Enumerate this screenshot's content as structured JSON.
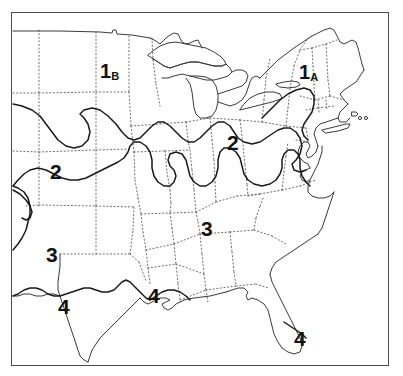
{
  "map": {
    "title": "Climate Zone Map of the Eastern and Central United States",
    "frame_color": "#4a4a4a",
    "background_color": "#ffffff",
    "coastline_color": "#3b3b3b",
    "zone_boundary_color": "#1a1a1a",
    "state_border_color": "#6e6e6e",
    "state_border_style": "dotted",
    "label_color": "#121212",
    "zones": [
      {
        "id": "zone-1b",
        "number": "1",
        "suffix": "B",
        "label": "1B",
        "x": 106,
        "y": 71,
        "region": "northern-plains"
      },
      {
        "id": "zone-1a",
        "number": "1",
        "suffix": "A",
        "label": "1A",
        "x": 305,
        "y": 72,
        "region": "new-england"
      },
      {
        "id": "zone-2-west",
        "number": "2",
        "suffix": "",
        "label": "2",
        "x": 54,
        "y": 172,
        "region": "central-plains"
      },
      {
        "id": "zone-2-east",
        "number": "2",
        "suffix": "",
        "label": "2",
        "x": 231,
        "y": 143,
        "region": "ohio-valley"
      },
      {
        "id": "zone-3-west",
        "number": "3",
        "suffix": "",
        "label": "3",
        "x": 50,
        "y": 255,
        "region": "southern-plains"
      },
      {
        "id": "zone-3-east",
        "number": "3",
        "suffix": "",
        "label": "3",
        "x": 205,
        "y": 229,
        "region": "southeast"
      },
      {
        "id": "zone-4-texas",
        "number": "4",
        "suffix": "",
        "label": "4",
        "x": 62,
        "y": 307,
        "region": "south-texas"
      },
      {
        "id": "zone-4-gulf",
        "number": "4",
        "suffix": "",
        "label": "4",
        "x": 152,
        "y": 296,
        "region": "gulf-coast"
      },
      {
        "id": "zone-4-florida",
        "number": "4",
        "suffix": "",
        "label": "4",
        "x": 298,
        "y": 339,
        "region": "south-florida"
      }
    ]
  }
}
